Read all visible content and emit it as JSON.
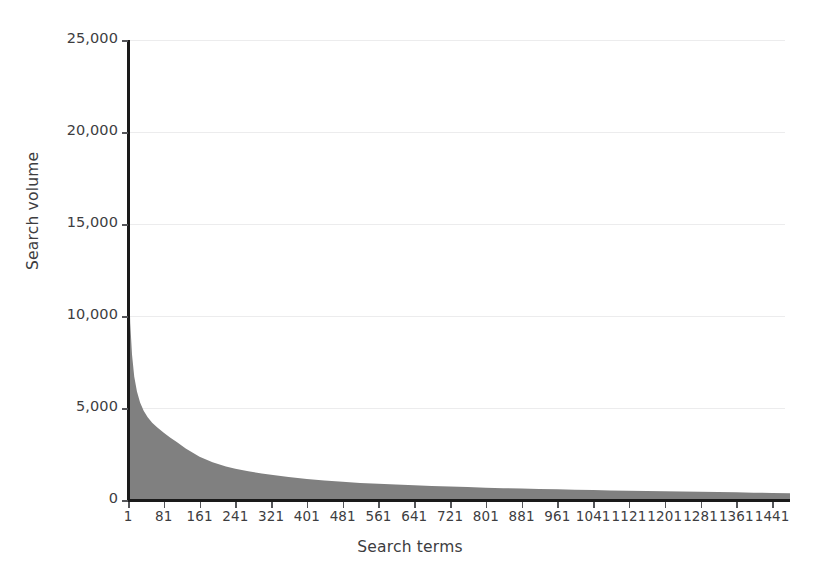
{
  "chart_data": {
    "type": "area",
    "title": "",
    "xlabel": "Search terms",
    "ylabel": "Search volume",
    "xlim": [
      1,
      1481
    ],
    "ylim": [
      0,
      25000
    ],
    "grid": true,
    "legend": null,
    "series_color": "#808080",
    "gridline_color": "#ececed",
    "axis_color": "#1a1a1a",
    "text_color": "#3d3d3f",
    "background": "#ffffff",
    "y_ticks": [
      0,
      5000,
      10000,
      15000,
      20000,
      25000
    ],
    "y_tick_labels": [
      "0",
      "5,000",
      "10,000",
      "15,000",
      "20,000",
      "25,000"
    ],
    "x_ticks": [
      1,
      81,
      161,
      241,
      321,
      401,
      481,
      561,
      641,
      721,
      801,
      881,
      961,
      1041,
      1121,
      1201,
      1281,
      1361,
      1441
    ],
    "x_tick_labels": [
      "1",
      "81",
      "161",
      "241",
      "321",
      "401",
      "481",
      "561",
      "641",
      "721",
      "801",
      "881",
      "961",
      "1041",
      "1121",
      "1201",
      "1281",
      "1361",
      "1441"
    ],
    "x": [
      1,
      3,
      6,
      10,
      15,
      21,
      28,
      36,
      45,
      55,
      66,
      81,
      95,
      110,
      130,
      161,
      190,
      220,
      241,
      270,
      300,
      321,
      360,
      401,
      440,
      481,
      520,
      561,
      600,
      641,
      680,
      721,
      760,
      801,
      840,
      881,
      920,
      961,
      1000,
      1041,
      1080,
      1121,
      1160,
      1201,
      1240,
      1281,
      1320,
      1361,
      1400,
      1441,
      1481
    ],
    "values": [
      15500,
      12100,
      9600,
      7900,
      6700,
      5900,
      5300,
      4850,
      4500,
      4200,
      3950,
      3650,
      3400,
      3150,
      2800,
      2350,
      2050,
      1820,
      1700,
      1560,
      1440,
      1370,
      1250,
      1140,
      1060,
      990,
      930,
      880,
      840,
      800,
      760,
      730,
      700,
      670,
      645,
      620,
      600,
      580,
      560,
      540,
      520,
      505,
      490,
      475,
      460,
      445,
      430,
      415,
      400,
      385,
      370
    ]
  }
}
